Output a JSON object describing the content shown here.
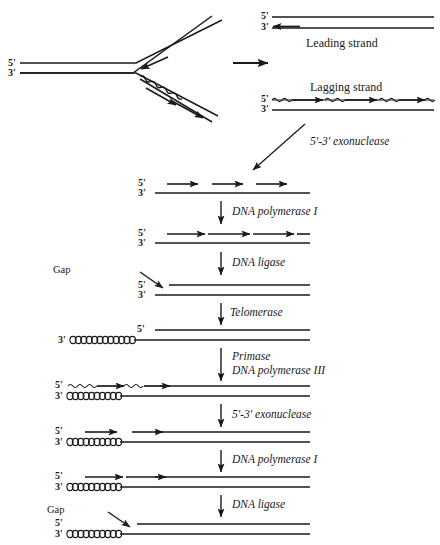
{
  "figure": {
    "type": "diagram"
  },
  "fork": {
    "top_prime_label": "5'",
    "bottom_prime_label": "3'",
    "transition_arrow": "rightward-arrow"
  },
  "products": {
    "leading": {
      "top_prime": "5'",
      "bottom_prime": "3'",
      "name": "Leading strand"
    },
    "lagging": {
      "name": "Lagging strand",
      "top_prime": "5'",
      "bottom_prime": "3'",
      "okazaki_fragments": 3
    }
  },
  "steps": [
    {
      "id": "exonuclease-1",
      "enzyme": "5'-3' exonuclease",
      "arrow": "diagonal-down-left"
    },
    {
      "id": "state-primers-removed",
      "top_prime": "5'",
      "bottom_prime": "3'",
      "arrows": 3
    },
    {
      "id": "pol1-1",
      "enzyme": "DNA polymerase I",
      "arrow": "down"
    },
    {
      "id": "state-gaps-filled",
      "top_prime": "5'",
      "bottom_prime": "3'",
      "arrows": 3
    },
    {
      "id": "ligase-1",
      "enzyme": "DNA ligase",
      "arrow": "down"
    },
    {
      "id": "state-ligated-gap",
      "top_prime": "5'",
      "bottom_prime": "3'",
      "gap_label": "Gap"
    },
    {
      "id": "telomerase",
      "enzyme": "Telomerase",
      "arrow": "down"
    },
    {
      "id": "state-telomere-extended",
      "top_prime": "5'",
      "bottom_prime": "3'",
      "telomere_repeats": 14
    },
    {
      "id": "primase-pol3",
      "enzyme_line1": "Primase",
      "enzyme_line2": "DNA polymerase III",
      "arrow": "down"
    },
    {
      "id": "state-new-primers",
      "top_prime": "5'",
      "bottom_prime": "3'",
      "okazaki_fragments": 2,
      "telomere_repeats": 14
    },
    {
      "id": "exonuclease-2",
      "enzyme": "5'-3' exonuclease",
      "arrow": "down"
    },
    {
      "id": "state-primers-removed-2",
      "top_prime": "5'",
      "bottom_prime": "3'",
      "arrows": 2,
      "telomere_repeats": 14
    },
    {
      "id": "pol1-2",
      "enzyme": "DNA polymerase I",
      "arrow": "down"
    },
    {
      "id": "state-gaps-filled-2",
      "top_prime": "5'",
      "bottom_prime": "3'",
      "arrows": 2,
      "telomere_repeats": 14
    },
    {
      "id": "ligase-2",
      "enzyme": "DNA ligase",
      "arrow": "down"
    },
    {
      "id": "state-final",
      "top_prime": "5'",
      "bottom_prime": "3'",
      "gap_label": "Gap",
      "telomere_repeats": 14
    }
  ],
  "colors": {
    "ink": "#1a1a1a",
    "background": "#ffffff"
  }
}
